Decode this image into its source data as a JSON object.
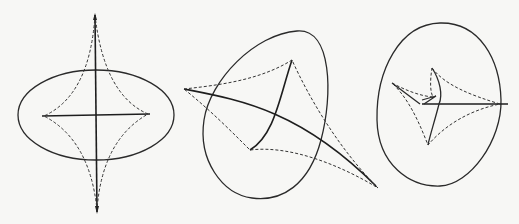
{
  "figure": {
    "panels": [
      {
        "id": "panel-1",
        "shape": "ellipse",
        "caustic": "astroid-like, 4 cusps"
      },
      {
        "id": "panel-2",
        "shape": "tilted oval",
        "caustic": "4 cusps, asymmetric"
      },
      {
        "id": "panel-3",
        "shape": "rounded triangular oval",
        "caustic": "4 cusps with swallowtail"
      }
    ]
  },
  "colors": {
    "background": "#f7f7f5",
    "stroke": "#2a2a2a"
  }
}
